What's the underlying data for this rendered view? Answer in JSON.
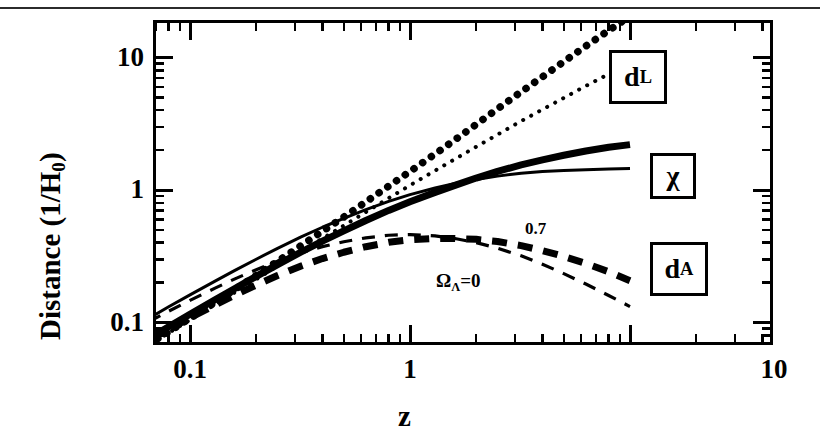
{
  "figure": {
    "kind": "scientific-line-plot",
    "background": "#ffffff",
    "ink": "#000000"
  },
  "axes": {
    "y_title_main": "Distance (1/H",
    "y_title_sub": "0",
    "y_title_close": ")",
    "y_title_full": "Distance (1/H0)",
    "x_title": "z",
    "y_ticks": [
      "10",
      "1",
      "0.1"
    ],
    "x_ticks": [
      "0.1",
      "1",
      "10"
    ]
  },
  "labels": {
    "dl_main": "d",
    "dl_sub": "L",
    "chi": "χ",
    "da_main": "d",
    "da_sub": "A",
    "omega_07": "0.7",
    "omega_0_main": "Ω",
    "omega_0_sub": "Λ",
    "omega_0_tail": "=0"
  },
  "chart_data": {
    "type": "line",
    "title": "",
    "xlabel": "z",
    "ylabel": "Distance (1/H0)",
    "xscale": "log",
    "yscale": "log",
    "xlim": [
      0.065,
      10
    ],
    "ylim": [
      0.062,
      22
    ],
    "xticks": [
      0.1,
      1,
      10
    ],
    "yticks": [
      0.1,
      1,
      10
    ],
    "grid": false,
    "legend": "inline-boxed-labels",
    "annotations": [
      {
        "text": "0.7",
        "x": 2.0,
        "y": 0.52,
        "note": "Omega_Lambda = 0.7 curve family (thick)"
      },
      {
        "text": "ΩΛ=0",
        "x": 1.35,
        "y": 0.245,
        "note": "Omega_Lambda = 0 curve family (thin)"
      },
      {
        "text": "dL",
        "x": 4.0,
        "y": 6.5,
        "note": "luminosity distance, boxed"
      },
      {
        "text": "χ",
        "x": 5.0,
        "y": 1.65,
        "note": "comoving distance, boxed"
      },
      {
        "text": "dA",
        "x": 5.0,
        "y": 0.3,
        "note": "angular diameter distance, boxed"
      }
    ],
    "series": [
      {
        "name": "d_L (Omega_Lambda=0.7)",
        "style": "dotted",
        "weight": "thick",
        "x": [
          0.065,
          0.08,
          0.1,
          0.13,
          0.16,
          0.2,
          0.25,
          0.32,
          0.4,
          0.5,
          0.63,
          0.8,
          1.0,
          1.3,
          1.6,
          2.0,
          2.5,
          3.2,
          4.0,
          5.0,
          6.3,
          8.0,
          10.0
        ],
        "y": [
          0.0685,
          0.085,
          0.1075,
          0.142,
          0.1775,
          0.2265,
          0.2895,
          0.381,
          0.488,
          0.625,
          0.813,
          1.07,
          1.38,
          1.87,
          2.39,
          3.13,
          4.1,
          5.5,
          7.15,
          9.3,
          12.2,
          16.0,
          20.5
        ]
      },
      {
        "name": "d_L (Omega_Lambda=0)",
        "style": "dotted",
        "weight": "thin",
        "x": [
          0.065,
          0.08,
          0.1,
          0.13,
          0.16,
          0.2,
          0.25,
          0.32,
          0.4,
          0.5,
          0.63,
          0.8,
          1.0,
          1.3,
          1.6,
          2.0,
          2.5,
          3.2,
          4.0,
          5.0,
          6.3,
          8.0,
          10.0
        ],
        "y": [
          0.0675,
          0.0835,
          0.1045,
          0.1365,
          0.169,
          0.212,
          0.267,
          0.344,
          0.431,
          0.538,
          0.681,
          0.868,
          1.085,
          1.4,
          1.71,
          2.12,
          2.62,
          3.31,
          4.05,
          4.95,
          6.1,
          7.5,
          9.05
        ]
      },
      {
        "name": "chi (Omega_Lambda=0.7)",
        "style": "solid",
        "weight": "thick",
        "x": [
          0.065,
          0.08,
          0.1,
          0.13,
          0.16,
          0.2,
          0.25,
          0.32,
          0.4,
          0.5,
          0.63,
          0.8,
          1.0,
          1.3,
          1.6,
          2.0,
          2.5,
          3.2,
          4.0,
          5.0,
          6.3,
          8.0,
          10.0
        ],
        "y": [
          0.0643,
          0.0787,
          0.0977,
          0.1257,
          0.153,
          0.1888,
          0.2316,
          0.2886,
          0.3486,
          0.4167,
          0.4988,
          0.5944,
          0.69,
          0.813,
          0.919,
          1.043,
          1.171,
          1.31,
          1.43,
          1.55,
          1.67,
          1.78,
          1.864
        ],
        "note": "thick solid comoving distance, reaches ~2.2 at z=10 on plot"
      },
      {
        "name": "chi (Omega_Lambda=0)",
        "style": "solid",
        "weight": "thin",
        "x": [
          0.065,
          0.08,
          0.1,
          0.13,
          0.16,
          0.2,
          0.25,
          0.32,
          0.4,
          0.5,
          0.63,
          0.8,
          1.0,
          1.3,
          1.6,
          2.0,
          2.5,
          3.2,
          4.0,
          5.0,
          6.3,
          8.0,
          10.0
        ],
        "y": [
          0.0634,
          0.0773,
          0.095,
          0.1208,
          0.1457,
          0.1767,
          0.2136,
          0.2605,
          0.3079,
          0.3587,
          0.4177,
          0.4822,
          0.5425,
          0.6087,
          0.6577,
          0.7067,
          0.7486,
          0.7881,
          0.81,
          0.825,
          0.838,
          0.847,
          0.854
        ],
        "note": "thin solid comoving distance, reaches ~1.45 at z=10 on plot"
      },
      {
        "name": "d_A (Omega_Lambda=0.7)",
        "style": "dashed",
        "weight": "thick",
        "x": [
          0.065,
          0.08,
          0.1,
          0.13,
          0.16,
          0.2,
          0.25,
          0.32,
          0.4,
          0.5,
          0.63,
          0.8,
          1.0,
          1.3,
          1.6,
          2.0,
          2.5,
          3.2,
          4.0,
          5.0,
          6.3,
          8.0,
          10.0
        ],
        "y": [
          0.0604,
          0.0729,
          0.0888,
          0.1113,
          0.1319,
          0.1573,
          0.1853,
          0.2186,
          0.249,
          0.2778,
          0.306,
          0.3302,
          0.345,
          0.3535,
          0.3535,
          0.3477,
          0.3346,
          0.3119,
          0.286,
          0.2583,
          0.2288,
          0.1978,
          0.1695
        ]
      },
      {
        "name": "d_A (Omega_Lambda=0)",
        "style": "dashed",
        "weight": "thin",
        "x": [
          0.065,
          0.08,
          0.1,
          0.13,
          0.16,
          0.2,
          0.25,
          0.32,
          0.4,
          0.5,
          0.63,
          0.8,
          1.0,
          1.3,
          1.6,
          2.0,
          2.5,
          3.2,
          4.0,
          5.0,
          6.3,
          8.0,
          10.0
        ],
        "y": [
          0.0595,
          0.0716,
          0.0864,
          0.1069,
          0.1256,
          0.1473,
          0.1709,
          0.1973,
          0.2199,
          0.2391,
          0.2562,
          0.2679,
          0.2713,
          0.2647,
          0.253,
          0.2356,
          0.2139,
          0.1876,
          0.162,
          0.1375,
          0.1148,
          0.0941,
          0.0776
        ]
      }
    ]
  }
}
